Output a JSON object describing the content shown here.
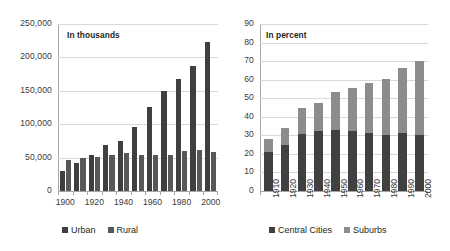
{
  "chart_data": [
    {
      "type": "bar",
      "id": "urban-rural-population",
      "title": "",
      "annotation": "In thousands",
      "xlabel": "",
      "ylabel": "",
      "ylim": [
        0,
        250000
      ],
      "ytick_step": 50000,
      "ytick_labels": [
        "250,000",
        "200,000",
        "150,000",
        "100,000",
        "50,000",
        "0"
      ],
      "grid": true,
      "legend_position": "bottom",
      "categories": [
        "1900",
        "1910",
        "1920",
        "1930",
        "1940",
        "1950",
        "1960",
        "1970",
        "1980",
        "1990",
        "2000"
      ],
      "tick_labels_shown": [
        "1900",
        "1920",
        "1940",
        "1960",
        "1980",
        "2000"
      ],
      "series": [
        {
          "name": "Urban",
          "color": "#3f3f3f",
          "values": [
            30160,
            41999,
            54158,
            68955,
            74424,
            96468,
            125269,
            149325,
            167051,
            187053,
            222361
          ]
        },
        {
          "name": "Rural",
          "color": "#585858",
          "values": [
            45835,
            49973,
            51553,
            53820,
            57246,
            54230,
            54054,
            53565,
            59495,
            61656,
            59063
          ]
        }
      ]
    },
    {
      "type": "bar",
      "id": "metropolitan-distribution",
      "subtype": "stacked",
      "title": "",
      "annotation": "In percent",
      "xlabel": "",
      "ylabel": "",
      "ylim": [
        0,
        90
      ],
      "ytick_step": 10,
      "ytick_labels": [
        "90",
        "80",
        "70",
        "60",
        "50",
        "40",
        "30",
        "20",
        "10",
        "0"
      ],
      "grid": true,
      "legend_position": "bottom",
      "categories": [
        "1910",
        "1920",
        "1930",
        "1940",
        "1950",
        "1960",
        "1970",
        "1980",
        "1990",
        "2000"
      ],
      "series": [
        {
          "name": "Central Cities",
          "color": "#404040",
          "values": [
            21.2,
            24.8,
            30.8,
            32.5,
            32.8,
            32.3,
            31.4,
            30.0,
            31.3,
            30.3
          ]
        },
        {
          "name": "Suburbs",
          "color": "#8c8c8c",
          "values": [
            7.1,
            9.0,
            13.8,
            15.1,
            20.5,
            23.3,
            26.9,
            30.4,
            35.1,
            39.9
          ]
        }
      ],
      "totals": [
        28.3,
        33.8,
        44.6,
        47.6,
        53.3,
        55.6,
        58.3,
        60.4,
        66.4,
        70.2
      ]
    }
  ],
  "left_chart": {
    "annotation": "In thousands",
    "legend": [
      {
        "label": "Urban",
        "color": "#3f3f3f"
      },
      {
        "label": "Rural",
        "color": "#585858"
      }
    ]
  },
  "right_chart": {
    "annotation": "In percent",
    "legend": [
      {
        "label": "Central Cities",
        "color": "#404040"
      },
      {
        "label": "Suburbs",
        "color": "#8c8c8c"
      }
    ]
  }
}
